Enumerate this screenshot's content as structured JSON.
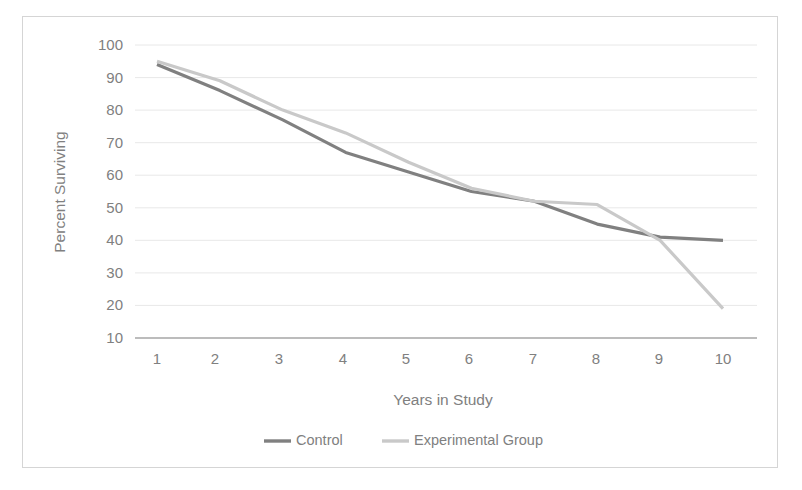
{
  "chart_data": {
    "type": "line",
    "title": "",
    "xlabel": "Years in Study",
    "ylabel": "Percent Surviving",
    "x": [
      1,
      2,
      3,
      4,
      5,
      6,
      7,
      8,
      9,
      10
    ],
    "x_tick_labels": [
      "1",
      "2",
      "3",
      "4",
      "5",
      "6",
      "7",
      "8",
      "9",
      "10"
    ],
    "y_tick_labels": [
      "100",
      "90",
      "80",
      "70",
      "60",
      "50",
      "40",
      "30",
      "20",
      "10"
    ],
    "y_ticks": [
      100,
      90,
      80,
      70,
      60,
      50,
      40,
      30,
      20,
      10
    ],
    "ylim": [
      10,
      100
    ],
    "xlim": [
      0.5,
      10.5
    ],
    "grid": "horizontal",
    "legend_position": "bottom",
    "series": [
      {
        "name": "Control",
        "color": "#808080",
        "values": [
          94,
          86,
          77,
          67,
          61,
          55,
          52,
          45,
          41,
          40
        ]
      },
      {
        "name": "Experimental Group",
        "color": "#c9c9c9",
        "values": [
          95,
          89,
          80,
          73,
          64,
          56,
          52,
          51,
          40,
          19
        ]
      }
    ]
  },
  "axes": {
    "y_title": "Percent Surviving",
    "x_title": "Years in Study",
    "y_labels": {
      "t0": "100",
      "t1": "90",
      "t2": "80",
      "t3": "70",
      "t4": "60",
      "t5": "50",
      "t6": "40",
      "t7": "30",
      "t8": "20",
      "t9": "10"
    },
    "x_labels": {
      "t0": "1",
      "t1": "2",
      "t2": "3",
      "t3": "4",
      "t4": "5",
      "t5": "6",
      "t6": "7",
      "t7": "8",
      "t8": "9",
      "t9": "10"
    }
  },
  "legend": {
    "item1_label": "Control",
    "item2_label": "Experimental Group"
  },
  "colors": {
    "control": "#808080",
    "experimental": "#c9c9c9",
    "gridline": "#e8e8e8",
    "axis": "#a6a6a6",
    "text": "#808080",
    "frame_border": "#d5d5d5"
  }
}
